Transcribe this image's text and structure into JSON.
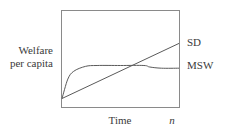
{
  "chart_data": {
    "type": "line",
    "title": "",
    "xlabel": "Time",
    "ylabel": "Welfare per capita",
    "ylabel_lines": [
      "Welfare",
      "per capita"
    ],
    "x_end_label": "n",
    "grid": false,
    "legend": "inline-right",
    "x": [
      0,
      0.05,
      0.1,
      0.2,
      0.3,
      0.5,
      0.7,
      0.75,
      0.85,
      1.0
    ],
    "xlim": [
      0,
      1
    ],
    "ylim": [
      0,
      1
    ],
    "series": [
      {
        "name": "SD",
        "description": "Linear increasing welfare (sustainable development)",
        "values": [
          0.1,
          0.145,
          0.19,
          0.28,
          0.37,
          0.55,
          0.73,
          0.775,
          0.865,
          1.01
        ]
      },
      {
        "name": "MSW",
        "description": "Rises quickly, plateaus, dips slightly after crossing SD",
        "values": [
          0.1,
          0.42,
          0.55,
          0.63,
          0.645,
          0.645,
          0.645,
          0.62,
          0.6,
          0.6
        ]
      }
    ],
    "intersection": {
      "x": 0.69,
      "y": 0.645
    }
  },
  "labels": {
    "ylabel_line1": "Welfare",
    "ylabel_line2": "per capita",
    "xlabel": "Time",
    "x_end": "n",
    "series_sd": "SD",
    "series_msw": "MSW"
  },
  "colors": {
    "axis": "#8a8a8a",
    "line": "#5a5a5a",
    "text": "#3a3a3a"
  }
}
